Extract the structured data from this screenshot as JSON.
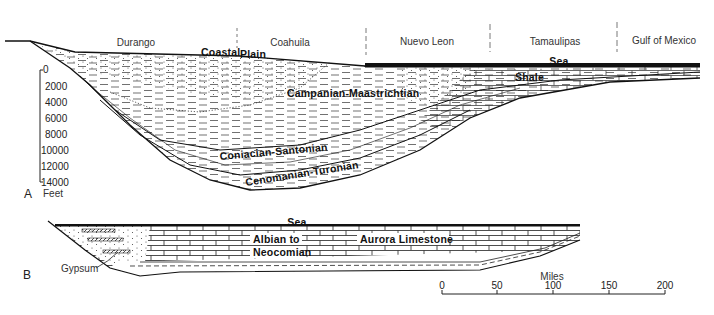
{
  "section_a": {
    "panel_label": "A",
    "regions": [
      {
        "label": "Durango",
        "x": 136
      },
      {
        "label": "Coahuila",
        "x": 290
      },
      {
        "label": "Nuevo Leon",
        "x": 427
      },
      {
        "label": "Tamaulipas",
        "x": 555
      },
      {
        "label": "Gulf of Mexico",
        "x": 660
      }
    ],
    "region_dividers_x": [
      237,
      366,
      490,
      617
    ],
    "surface_labels": {
      "coastal": "Coastal",
      "plain": "Plain",
      "sea": "Sea"
    },
    "units": [
      {
        "label": "Campanian-Maastrichtian"
      },
      {
        "label": "Shale"
      },
      {
        "label": "Coniacian-Santonian"
      },
      {
        "label": "Cenomanian-Turonian"
      }
    ],
    "depth_axis": {
      "unit": "Feet",
      "ticks": [
        "0",
        "2000",
        "4000",
        "6000",
        "8000",
        "10000",
        "12000",
        "14000"
      ]
    }
  },
  "section_b": {
    "panel_label": "B",
    "surface_label": "Sea",
    "units": [
      {
        "label": "Albian to"
      },
      {
        "label": "Aurora Limestone"
      },
      {
        "label": "Neocomian"
      }
    ],
    "callout": "Gypsum"
  },
  "scale_bar": {
    "title": "Miles",
    "ticks": [
      "0",
      "50",
      "100",
      "150",
      "200"
    ]
  },
  "colors": {
    "ink": "#111111",
    "background": "#ffffff"
  }
}
